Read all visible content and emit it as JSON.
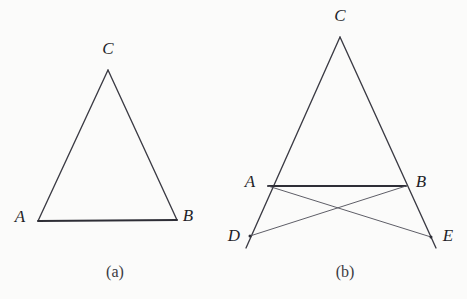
{
  "figure": {
    "background_color": "#fbfbfa",
    "stroke_color": "#3b3b44",
    "panels": [
      {
        "id": "a",
        "caption": "(a)",
        "caption_x": 115,
        "caption_y": 277,
        "description": "Isosceles triangle ABC with apex C at top, base AB at bottom",
        "points": [
          {
            "name": "A",
            "label": "A",
            "x": 38,
            "y": 221,
            "label_x": 20,
            "label_y": 222
          },
          {
            "name": "B",
            "label": "B",
            "x": 177,
            "y": 220,
            "label_x": 188,
            "label_y": 221
          },
          {
            "name": "C",
            "label": "C",
            "x": 108,
            "y": 70,
            "label_x": 103,
            "label_y": 54
          }
        ],
        "edges": [
          {
            "name": "side-CA",
            "from": "C",
            "to": "A",
            "weight": "main"
          },
          {
            "name": "side-CB",
            "from": "C",
            "to": "B",
            "weight": "main"
          },
          {
            "name": "base-AB",
            "from": "A",
            "to": "B",
            "weight": "base"
          }
        ]
      },
      {
        "id": "b",
        "caption": "(b)",
        "caption_x": 345,
        "caption_y": 277,
        "description": "Triangle ABC with sides extended past A to D and past B to E, plus crossing segments AE and BD",
        "points": [
          {
            "name": "A",
            "label": "A",
            "x": 268,
            "y": 186,
            "label_x": 248,
            "label_y": 187
          },
          {
            "name": "B",
            "label": "B",
            "x": 406,
            "y": 186,
            "label_x": 414,
            "label_y": 187
          },
          {
            "name": "C",
            "label": "C",
            "x": 340,
            "y": 37,
            "label_x": 334,
            "label_y": 21
          },
          {
            "name": "D",
            "label": "D",
            "x": 250,
            "y": 236,
            "label_x": 228,
            "label_y": 240
          },
          {
            "name": "E",
            "label": "E",
            "x": 431,
            "y": 237,
            "label_x": 441,
            "label_y": 240
          }
        ],
        "edges": [
          {
            "name": "side-CD-through-A",
            "from": "C",
            "to": "D-extended",
            "weight": "main"
          },
          {
            "name": "side-CE-through-B",
            "from": "C",
            "to": "E-extended",
            "weight": "main"
          },
          {
            "name": "base-AB",
            "from": "A",
            "to": "B",
            "weight": "base"
          },
          {
            "name": "cross-AE",
            "from": "A",
            "to": "E",
            "weight": "thin"
          },
          {
            "name": "cross-BD",
            "from": "B",
            "to": "D",
            "weight": "thin"
          }
        ],
        "crossing_point": {
          "name": "intersection-AE-BD",
          "x": 337,
          "y": 211
        }
      }
    ]
  }
}
